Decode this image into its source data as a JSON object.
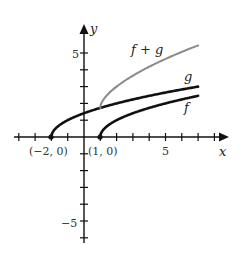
{
  "chart_data": {
    "type": "line",
    "title": "",
    "xlabel": "x",
    "ylabel": "y",
    "xlim": [
      -4.2,
      8.8
    ],
    "ylim": [
      -6.3,
      6.5
    ],
    "x_ticks": [
      -4,
      -3,
      -2,
      -1,
      1,
      2,
      3,
      4,
      5,
      6,
      7,
      8
    ],
    "y_ticks": [
      -6,
      -5,
      -4,
      -3,
      -2,
      -1,
      1,
      2,
      3,
      4,
      5
    ],
    "x_tick_labels": [
      {
        "value": 5,
        "label": "5"
      }
    ],
    "y_tick_labels": [
      {
        "value": 5,
        "label": "5"
      },
      {
        "value": -5,
        "label": "−5"
      }
    ],
    "grid": false,
    "series": [
      {
        "name": "f",
        "label": "f",
        "formula": "sqrt(x - 1)",
        "domain": [
          1,
          7
        ],
        "color": "#111111",
        "x": [
          1,
          1.25,
          1.5,
          2,
          3,
          4,
          5,
          6,
          7
        ],
        "values": [
          0,
          0.5,
          0.71,
          1,
          1.41,
          1.73,
          2,
          2.24,
          2.45
        ]
      },
      {
        "name": "g",
        "label": "g",
        "formula": "sqrt(x + 2)",
        "domain": [
          -2,
          7
        ],
        "color": "#111111",
        "x": [
          -2,
          -1.75,
          -1.5,
          -1,
          0,
          1,
          2,
          3,
          4,
          5,
          6,
          7
        ],
        "values": [
          0,
          0.5,
          0.71,
          1,
          1.41,
          1.73,
          2,
          2.24,
          2.45,
          2.65,
          2.83,
          3
        ]
      },
      {
        "name": "f + g",
        "label": "f + g",
        "formula": "sqrt(x - 1) + sqrt(x + 2)",
        "domain": [
          1,
          7
        ],
        "color": "#8a8a8a",
        "x": [
          1,
          1.25,
          1.5,
          2,
          3,
          4,
          5,
          6,
          7
        ],
        "values": [
          1.73,
          2.3,
          2.58,
          3,
          3.65,
          4.18,
          4.65,
          5.07,
          5.45
        ]
      }
    ],
    "annotations": [
      {
        "text": "(−2, 0)",
        "x": -2,
        "y": 0,
        "marker": "dot"
      },
      {
        "text": "(1, 0)",
        "x": 1,
        "y": 0,
        "marker": "dot"
      }
    ]
  },
  "labels": {
    "x_axis": "x",
    "y_axis": "y",
    "tick5": "5",
    "ytick5": "5",
    "ytickm5": "−5",
    "pt_left": "(−2, 0)",
    "pt_right": "(1, 0)",
    "f": "f",
    "g": "g",
    "fg": "f + g"
  }
}
